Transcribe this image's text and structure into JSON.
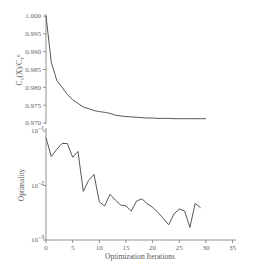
{
  "chart_data": [
    {
      "type": "line",
      "title": "",
      "xlabel": "",
      "ylabel": "C_T(X)/C_T^0",
      "xlim": [
        0,
        35
      ],
      "ylim": [
        0.97,
        1.0
      ],
      "yticks": [
        "1.000",
        "0.995",
        "0.990",
        "0.985",
        "0.980",
        "0.975",
        "0.970"
      ],
      "grid": false,
      "series": [
        {
          "name": "normalized cost",
          "x": [
            0,
            1,
            2,
            3,
            4,
            5,
            6,
            7,
            8,
            9,
            10,
            11,
            12,
            13,
            14,
            15,
            16,
            17,
            18,
            19,
            20,
            21,
            22,
            23,
            24,
            25,
            26,
            27,
            28,
            29,
            30
          ],
          "values": [
            1.0,
            0.987,
            0.982,
            0.98,
            0.978,
            0.9765,
            0.9755,
            0.9745,
            0.974,
            0.9735,
            0.9732,
            0.973,
            0.9727,
            0.9722,
            0.972,
            0.9718,
            0.9717,
            0.9716,
            0.9715,
            0.9714,
            0.9714,
            0.9713,
            0.9713,
            0.9713,
            0.9712,
            0.9712,
            0.9712,
            0.9712,
            0.9712,
            0.9712,
            0.9712
          ]
        }
      ]
    },
    {
      "type": "line",
      "title": "",
      "xlabel": "Optimization Iterations",
      "ylabel": "Optimality",
      "xlim": [
        0,
        35
      ],
      "xticks": [
        "0",
        "5",
        "10",
        "15",
        "20",
        "25",
        "30",
        "35"
      ],
      "yscale": "log",
      "ylim": [
        0.001,
        0.1
      ],
      "yticks": [
        "10^-1",
        "10^-2",
        "10^-3"
      ],
      "grid": false,
      "series": [
        {
          "name": "optimality",
          "x": [
            0,
            1,
            2,
            3,
            4,
            5,
            6,
            7,
            8,
            9,
            10,
            11,
            12,
            13,
            14,
            15,
            16,
            17,
            18,
            19,
            20,
            21,
            22,
            23,
            24,
            25,
            26,
            27,
            28,
            29
          ],
          "values": [
            0.075,
            0.034,
            0.046,
            0.059,
            0.059,
            0.033,
            0.042,
            0.0078,
            0.0124,
            0.016,
            0.005,
            0.0042,
            0.0069,
            0.0054,
            0.0044,
            0.0042,
            0.0034,
            0.0052,
            0.0057,
            0.0046,
            0.004,
            0.0032,
            0.0025,
            0.0019,
            0.003,
            0.0037,
            0.0034,
            0.0017,
            0.0047,
            0.0039
          ]
        }
      ]
    }
  ],
  "labels": {
    "top_ylabel_main": "C",
    "top_ylabel_sub": "T",
    "top_ylabel_rest": "(X)/C",
    "top_ylabel_sup": "0",
    "bottom_ylabel": "Optimality",
    "xlabel": "Optimization Iterations",
    "top_yticks": [
      "1.000",
      "0.995",
      "0.990",
      "0.985",
      "0.980",
      "0.975",
      "0.970"
    ],
    "bottom_yticks_base": [
      "10",
      "10",
      "10"
    ],
    "bottom_yticks_exp": [
      "-1",
      "-2",
      "-3"
    ],
    "xticks": [
      "0",
      "5",
      "10",
      "15",
      "20",
      "25",
      "30",
      "35"
    ]
  },
  "colors": {
    "line": "#444444",
    "axis": "#777777",
    "text": "#555555",
    "background": "#ffffff"
  }
}
